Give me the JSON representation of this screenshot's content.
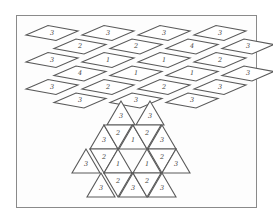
{
  "figure": {
    "rhombus_section": {
      "rows": [
        {
          "offset": 0,
          "labels": [
            "3",
            "3",
            "3",
            "3"
          ]
        },
        {
          "offset": 1,
          "labels": [
            "2",
            "2",
            "4",
            "3"
          ]
        },
        {
          "offset": 0,
          "labels": [
            "3",
            "1",
            "1",
            "2"
          ]
        },
        {
          "offset": 1,
          "labels": [
            "4",
            "1",
            "1",
            "3"
          ]
        },
        {
          "offset": 0,
          "labels": [
            "3",
            "2",
            "2",
            "3"
          ]
        },
        {
          "offset": 1,
          "labels": [
            "3",
            "3",
            "3"
          ]
        }
      ]
    },
    "triangle_section": {
      "triangles": [
        {
          "label": "3",
          "up": true
        },
        {
          "label": "3",
          "up": true
        },
        {
          "label": "3",
          "up": true
        },
        {
          "label": "2",
          "up": false
        },
        {
          "label": "1",
          "up": true
        },
        {
          "label": "2",
          "up": false
        },
        {
          "label": "3",
          "up": true
        },
        {
          "label": "3",
          "up": true
        },
        {
          "label": "2",
          "up": false
        },
        {
          "label": "1",
          "up": true
        },
        {
          "label": "1",
          "up": true
        },
        {
          "label": "2",
          "up": false
        },
        {
          "label": "3",
          "up": true
        },
        {
          "label": "3",
          "up": true
        },
        {
          "label": "2",
          "up": false
        },
        {
          "label": "3",
          "up": true
        },
        {
          "label": "2",
          "up": false
        },
        {
          "label": "3",
          "up": true
        }
      ]
    }
  }
}
